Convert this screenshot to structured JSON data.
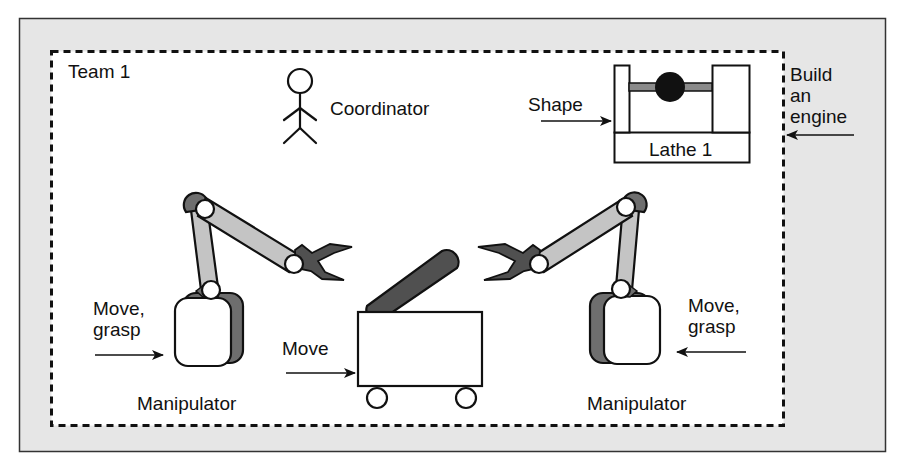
{
  "colors": {
    "frame_bg": "#e6e6e6",
    "team_bg": "#ffffff",
    "stroke": "#111111",
    "arm_light": "#c4c4c4",
    "arm_dark": "#505050",
    "shadow": "#6e6e6e"
  },
  "team": {
    "label": "Team 1"
  },
  "coordinator": {
    "label": "Coordinator"
  },
  "lathe": {
    "label": "Lathe 1",
    "input_label": "Shape"
  },
  "external_input": {
    "lines": [
      "Build",
      "an",
      "engine"
    ]
  },
  "left_manipulator": {
    "label": "Manipulator",
    "input_lines": [
      "Move,",
      "grasp"
    ]
  },
  "right_manipulator": {
    "label": "Manipulator",
    "input_lines": [
      "Move,",
      "grasp"
    ]
  },
  "cart": {
    "input_label": "Move"
  }
}
